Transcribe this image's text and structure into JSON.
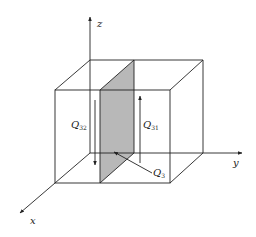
{
  "figure": {
    "type": "3d-box-heat-flow-diagram",
    "axes": {
      "x": "x",
      "y": "y",
      "z": "z"
    },
    "labels": {
      "q32": {
        "base": "Q",
        "sub": "32"
      },
      "q31": {
        "base": "Q",
        "sub": "31"
      },
      "q3": {
        "base": "Q",
        "sub": "3"
      }
    },
    "colors": {
      "line": "#222222",
      "plane_fill": "#b8b8b8",
      "background": "#ffffff"
    }
  }
}
